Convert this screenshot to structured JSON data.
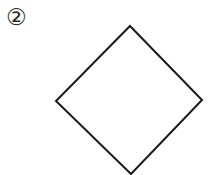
{
  "canvas": {
    "width": 211,
    "height": 175,
    "background_color": "#ffffff"
  },
  "label": {
    "text": "②",
    "name": "circled-number-two",
    "value": "2",
    "color": "#2b2b2b",
    "x": 7,
    "y": 7
  },
  "figure": {
    "shape_name": "diamond",
    "fill": "none",
    "stroke_color": "#1a1a1a",
    "stroke_width": 2,
    "vertices": {
      "top": [
        130,
        26
      ],
      "right": [
        202,
        100
      ],
      "bottom": [
        131,
        174
      ],
      "left": [
        56,
        101
      ]
    },
    "points": "130,26 202,100 131,174 56,101"
  }
}
